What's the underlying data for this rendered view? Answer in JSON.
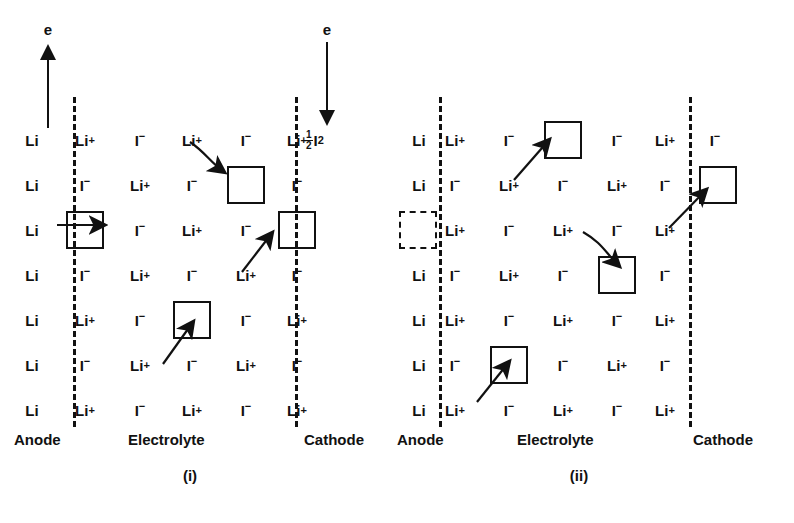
{
  "figure": {
    "species": {
      "lithium_metal": "Li",
      "lithium_ion": "Li",
      "lithium_ion_charge": "+",
      "iodide_ion": "I",
      "iodide_ion_charge": "−",
      "half_iodine_num": "1",
      "half_iodine_den": "2",
      "half_iodine_symbol": "I",
      "half_iodine_sub": "2"
    },
    "electron_label": "e",
    "panels": [
      {
        "id": "i",
        "caption": "(i)",
        "electron_arrow_direction": "up",
        "electron_arrow_label": "e",
        "region_labels": {
          "anode": "Anode",
          "electrolyte": "Electrolyte",
          "cathode": "Cathode"
        },
        "cathode_species": {
          "num": "1",
          "den": "2",
          "symbol": "I",
          "sub": "2"
        },
        "anode_vacancy": false,
        "rows": [
          {
            "anode": "Li",
            "electrolyte": [
              "Li+",
              "I-",
              "Li+",
              "I-",
              "Li+"
            ]
          },
          {
            "anode": "Li",
            "electrolyte": [
              "I-",
              "Li+",
              "I-",
              "box",
              "I-"
            ]
          },
          {
            "anode": "Li",
            "electrolyte": [
              "box",
              "I-",
              "Li+",
              "I-",
              "box"
            ]
          },
          {
            "anode": "Li",
            "electrolyte": [
              "I-",
              "Li+",
              "I-",
              "Li+",
              "I-"
            ]
          },
          {
            "anode": "Li",
            "electrolyte": [
              "Li+",
              "I-",
              "box",
              "I-",
              "Li+"
            ]
          },
          {
            "anode": "Li",
            "electrolyte": [
              "I-",
              "Li+",
              "I-",
              "Li+",
              "I-"
            ]
          },
          {
            "anode": "Li",
            "electrolyte": [
              "Li+",
              "I-",
              "Li+",
              "I-",
              "Li+"
            ]
          }
        ],
        "hops": [
          {
            "from": "row1-col3-Li+",
            "to": "row2-col4-box",
            "kind": "curved"
          },
          {
            "from": "anode-Li-row3",
            "to": "row3-col1-box",
            "kind": "straight"
          },
          {
            "from": "row4-col4-Li+",
            "to": "row3-col5-box",
            "kind": "straight"
          },
          {
            "from": "row6-col2-Li+",
            "to": "row5-col3-box",
            "kind": "straight"
          }
        ]
      },
      {
        "id": "ii",
        "caption": "(ii)",
        "electron_arrow_direction": "down",
        "electron_arrow_label": "e",
        "region_labels": {
          "anode": "Anode",
          "electrolyte": "Electrolyte",
          "cathode": "Cathode"
        },
        "cathode_species": {
          "symbol": "I",
          "charge": "−"
        },
        "anode_vacancy": true,
        "rows": [
          {
            "anode": "Li",
            "electrolyte": [
              "Li+",
              "I-",
              "box",
              "I-",
              "Li+"
            ],
            "cathode": "I-"
          },
          {
            "anode": "Li",
            "electrolyte": [
              "I-",
              "Li+",
              "I-",
              "Li+",
              "I-"
            ],
            "cathode": "box"
          },
          {
            "anode": "vacancy",
            "electrolyte": [
              "Li+",
              "I-",
              "Li+",
              "I-",
              "Li+"
            ]
          },
          {
            "anode": "Li",
            "electrolyte": [
              "I-",
              "Li+",
              "I-",
              "box",
              "I-"
            ]
          },
          {
            "anode": "Li",
            "electrolyte": [
              "Li+",
              "I-",
              "Li+",
              "I-",
              "Li+"
            ]
          },
          {
            "anode": "Li",
            "electrolyte": [
              "I-",
              "box",
              "I-",
              "Li+",
              "I-"
            ]
          },
          {
            "anode": "Li",
            "electrolyte": [
              "Li+",
              "I-",
              "Li+",
              "I-",
              "Li+"
            ]
          }
        ],
        "hops": [
          {
            "from": "row2-col2-Li+",
            "to": "row1-col3-box",
            "kind": "straight"
          },
          {
            "from": "row3-col5-Li+",
            "to": "cathode-row2-box",
            "kind": "straight"
          },
          {
            "from": "row3-col3-Li+",
            "to": "row4-col4-box",
            "kind": "curved"
          },
          {
            "from": "row7-col1-Li+",
            "to": "row6-col2-box",
            "kind": "straight"
          }
        ]
      }
    ]
  }
}
